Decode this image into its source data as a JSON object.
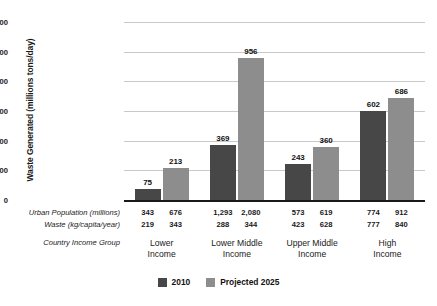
{
  "chart_data": {
    "type": "bar",
    "title": "",
    "xlabel": "Country Income Group",
    "ylabel": "Waste Generated (millions tons/day)",
    "ylim": [
      0,
      1200
    ],
    "yticks": [
      0,
      200,
      400,
      600,
      800,
      1000,
      1200
    ],
    "ytick_labels": [
      "0",
      "200",
      "400",
      "600",
      "800",
      "1,000",
      "1,200"
    ],
    "grid": true,
    "legend_position": "bottom-center",
    "categories": [
      "Lower Income",
      "Lower Middle Income",
      "Upper Middle Income",
      "High Income"
    ],
    "category_lines": [
      [
        "Lower",
        "Income"
      ],
      [
        "Lower Middle",
        "Income"
      ],
      [
        "Upper Middle",
        "Income"
      ],
      [
        "High",
        "Income"
      ]
    ],
    "series": [
      {
        "name": "2010",
        "color": "#474747",
        "values": [
          75,
          369,
          243,
          602
        ]
      },
      {
        "name": "Projected 2025",
        "color": "#8d8d8d",
        "values": [
          213,
          956,
          360,
          686
        ]
      }
    ],
    "annotations": {
      "rows": [
        {
          "label": "Urban Population (millions)",
          "values": [
            [
              "343",
              "676"
            ],
            [
              "1,293",
              "2,080"
            ],
            [
              "573",
              "619"
            ],
            [
              "774",
              "912"
            ]
          ]
        },
        {
          "label": "Waste (kg/capita/year)",
          "values": [
            [
              "219",
              "343"
            ],
            [
              "288",
              "344"
            ],
            [
              "423",
              "628"
            ],
            [
              "777",
              "840"
            ]
          ]
        }
      ],
      "group_row_label": "Country Income Group"
    }
  },
  "legend": {
    "items": [
      {
        "label": "2010",
        "color": "#474747"
      },
      {
        "label": "Projected 2025",
        "color": "#8d8d8d"
      }
    ]
  }
}
